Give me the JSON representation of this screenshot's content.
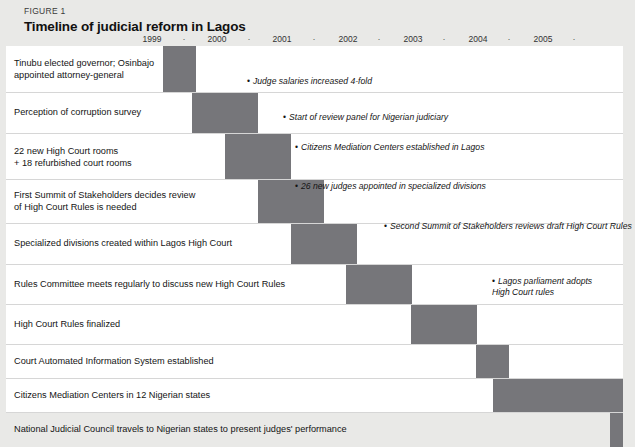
{
  "figure": {
    "number_label": "FIGURE 1",
    "title": "Timeline of judicial reform in Lagos"
  },
  "colors": {
    "bar": "#76767a",
    "page_background": "#e9e9e7",
    "plot_background": "#ffffff",
    "row_divider": "#d6d6d6",
    "text": "#141414"
  },
  "axis": {
    "years": [
      "1999",
      "2000",
      "2001",
      "2002",
      "2003",
      "2004",
      "2005"
    ],
    "separator_glyph": "·",
    "separator_count": 7
  },
  "chart_data": {
    "type": "bar",
    "title": "Timeline of judicial reform in Lagos",
    "xlabel": "",
    "ylabel": "",
    "orientation": "horizontal",
    "grid": false,
    "legend": "none",
    "xlim": [
      "1999.0",
      "2005.75"
    ],
    "x_tick_labels": [
      "1999",
      "2000",
      "2001",
      "2002",
      "2003",
      "2004",
      "2005"
    ],
    "categories": [
      "Tinubu elected governor; Osinbajo appointed attorney-general",
      "Perception of corruption survey",
      "22 new High Court rooms + 18 refurbished court rooms",
      "First Summit of Stakeholders decides review of High Court Rules is needed",
      "Specialized divisions created within Lagos High Court",
      "Rules Committee meets regularly to discuss new High Court Rules",
      "High Court Rules finalized",
      "Court Automated Information System established",
      "Citizens Mediation Centers in 12 Nigerian states",
      "National Judicial Council travels to Nigerian states to present judges' performance"
    ],
    "bars": [
      {
        "label": "Tinubu elected governor; Osinbajo appointed attorney-general",
        "start": 1999.0,
        "end": 1999.5
      },
      {
        "label": "Perception of corruption survey",
        "start": 1999.45,
        "end": 1500.0
      },
      {
        "label": "22 new High Court rooms + 18 refurbished court rooms",
        "start": 2000.0,
        "end": 2001.0
      },
      {
        "label": "First Summit of Stakeholders decides review of High Court Rules is needed",
        "start": 2000.5,
        "end": 2001.5
      },
      {
        "label": "Specialized divisions created within Lagos High Court",
        "start": 2001.0,
        "end": 2002.0
      },
      {
        "label": "Rules Committee meets regularly to discuss new High Court Rules",
        "start": 2001.9,
        "end": 2002.9
      },
      {
        "label": "High Court Rules finalized",
        "start": 2002.9,
        "end": 2003.9
      },
      {
        "label": "Court Automated Information System established",
        "start": 2003.9,
        "end": 2004.4
      },
      {
        "label": "Citizens Mediation Centers in 12 Nigerian states",
        "start": 2004.2,
        "end": 2006.1
      },
      {
        "label": "National Judicial Council travels to Nigerian states to present judges' performance",
        "start": 2005.9,
        "end": 2006.1
      }
    ]
  },
  "rows": [
    {
      "id": "row-tinubu-elected",
      "label": "Tinubu elected governor; Osinbajo\nappointed attorney-general",
      "top": 0,
      "height": 46,
      "label_top": 12,
      "bar": {
        "left": 157,
        "width": 33,
        "top": 0,
        "height": 46
      }
    },
    {
      "id": "row-perception-survey",
      "label": "Perception of corruption survey",
      "top": 46,
      "height": 41,
      "label_top": 14,
      "bar": {
        "left": 186,
        "width": 66,
        "top": 0,
        "height": 41
      }
    },
    {
      "id": "row-new-court-rooms",
      "label": "22 new High Court rooms\n+ 18 refurbished court rooms",
      "top": 87,
      "height": 46,
      "label_top": 12,
      "bar": {
        "left": 219,
        "width": 66,
        "top": 0,
        "height": 46
      }
    },
    {
      "id": "row-first-summit",
      "label": "First Summit of Stakeholders decides review\nof High Court Rules is needed",
      "top": 133,
      "height": 44,
      "label_top": 10,
      "bar": {
        "left": 252,
        "width": 66,
        "top": 0,
        "height": 44
      }
    },
    {
      "id": "row-specialized-divisions",
      "label": "Specialized divisions created within Lagos High Court",
      "top": 177,
      "height": 41,
      "label_top": 14,
      "bar": {
        "left": 285,
        "width": 66,
        "top": 0,
        "height": 41
      }
    },
    {
      "id": "row-rules-committee",
      "label": "Rules Committee meets regularly to discuss new High Court Rules",
      "top": 218,
      "height": 40,
      "label_top": 14,
      "bar": {
        "left": 340,
        "width": 66,
        "top": 0,
        "height": 40
      }
    },
    {
      "id": "row-rules-finalized",
      "label": "High Court Rules finalized",
      "top": 258,
      "height": 40,
      "label_top": 14,
      "bar": {
        "left": 405,
        "width": 66,
        "top": 0,
        "height": 40
      }
    },
    {
      "id": "row-court-automated-system",
      "label": "Court Automated Information System established",
      "top": 298,
      "height": 34,
      "label_top": 11,
      "bar": {
        "left": 470,
        "width": 33,
        "top": 0,
        "height": 34
      }
    },
    {
      "id": "row-mediation-centers-states",
      "label": "Citizens Mediation Centers in 12 Nigerian states",
      "top": 332,
      "height": 34,
      "label_top": 11,
      "bar": {
        "left": 487,
        "width": 130,
        "top": 0,
        "height": 34
      }
    },
    {
      "id": "row-national-judicial-council",
      "label": "National Judicial Council travels to Nigerian states to present judges' performance",
      "top": 366,
      "height": 34,
      "label_top": 11,
      "bar": {
        "left": 604,
        "width": 13,
        "top": 0,
        "height": 34
      }
    }
  ],
  "notes": [
    {
      "id": "note-judge-salaries",
      "bullet": "•",
      "text": "Judge salaries increased 4-fold",
      "left": 247,
      "top": 76
    },
    {
      "id": "note-review-panel",
      "bullet": "•",
      "text": "Start of review panel for Nigerian judiciary",
      "left": 283,
      "top": 112
    },
    {
      "id": "note-mediation-centers-lagos",
      "bullet": "•",
      "text": "Citizens Mediation Centers established in Lagos",
      "left": 295,
      "top": 142
    },
    {
      "id": "note-26-new-judges",
      "bullet": "•",
      "text": "26 new judges appointed in specialized divisions",
      "left": 295,
      "top": 181
    },
    {
      "id": "note-second-summit",
      "bullet": "•",
      "text": "Second Summit of Stakeholders reviews draft High Court Rules",
      "left": 384,
      "top": 221
    },
    {
      "id": "note-lagos-parliament",
      "bullet": "•",
      "text": "Lagos parliament adopts\nHigh Court rules",
      "left": 492,
      "top": 276
    }
  ]
}
